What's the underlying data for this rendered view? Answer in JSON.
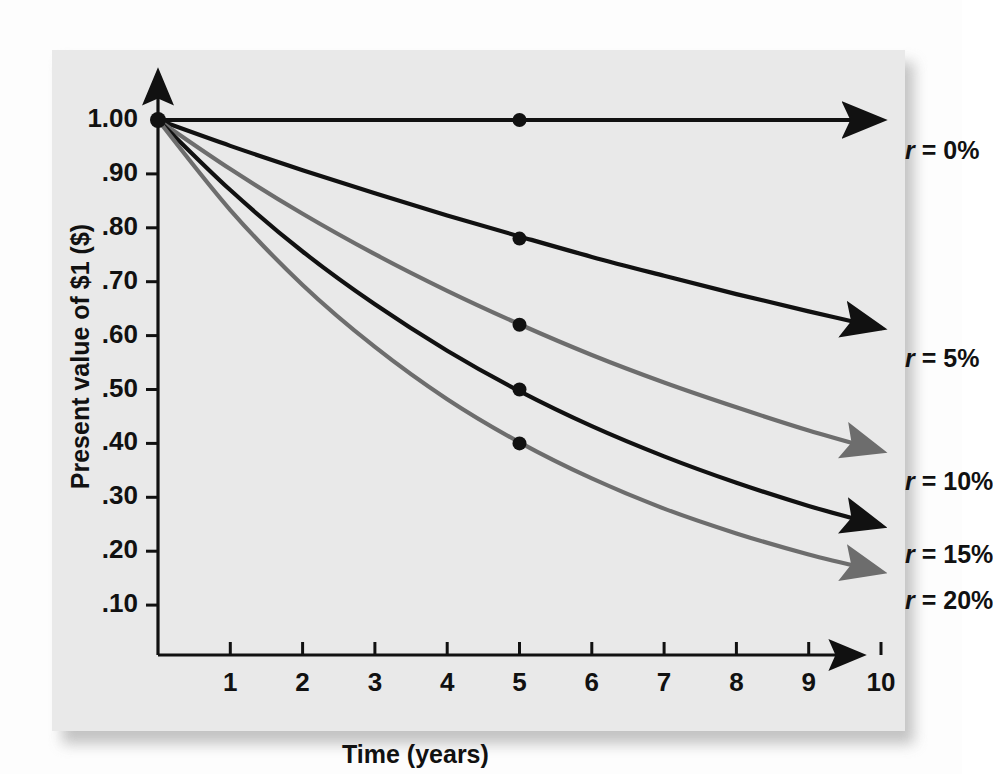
{
  "figure": {
    "background_color": "#e9e9e9",
    "page_color": "#fdfdfd"
  },
  "chart_data": {
    "type": "line",
    "title": "",
    "xlabel": "Time (years)",
    "ylabel": "Present value of $1 ($)",
    "xlim": [
      0,
      10
    ],
    "ylim": [
      0,
      1.0
    ],
    "grid": false,
    "legend_position": "right-inline-labels",
    "x": [
      0,
      1,
      2,
      3,
      4,
      5,
      6,
      7,
      8,
      9,
      10
    ],
    "xtick_labels": [
      "1",
      "2",
      "3",
      "4",
      "5",
      "6",
      "7",
      "8",
      "9",
      "10"
    ],
    "xticks": [
      1,
      2,
      3,
      4,
      5,
      6,
      7,
      8,
      9,
      10
    ],
    "ytick_labels": [
      "1.00",
      ".90",
      ".80",
      ".70",
      ".60",
      ".50",
      ".40",
      ".30",
      ".20",
      ".10"
    ],
    "yticks": [
      1.0,
      0.9,
      0.8,
      0.7,
      0.6,
      0.5,
      0.4,
      0.3,
      0.2,
      0.1
    ],
    "marker_x": 5,
    "series": [
      {
        "name": "r = 0%",
        "rate": 0.0,
        "color": "#111111",
        "values": [
          1.0,
          1.0,
          1.0,
          1.0,
          1.0,
          1.0,
          1.0,
          1.0,
          1.0,
          1.0,
          1.0
        ],
        "marker_value": 1.0,
        "label_prefix": "r",
        "label_suffix": " = 0%"
      },
      {
        "name": "r = 5%",
        "rate": 0.05,
        "color": "#111111",
        "values": [
          1.0,
          0.952,
          0.907,
          0.864,
          0.823,
          0.784,
          0.746,
          0.711,
          0.677,
          0.645,
          0.614
        ],
        "marker_value": 0.78,
        "label_prefix": "r",
        "label_suffix": " = 5%"
      },
      {
        "name": "r = 10%",
        "rate": 0.1,
        "color": "#6d6d6d",
        "values": [
          1.0,
          0.909,
          0.826,
          0.751,
          0.683,
          0.621,
          0.564,
          0.513,
          0.467,
          0.424,
          0.386
        ],
        "marker_value": 0.62,
        "label_prefix": "r",
        "label_suffix": " = 10%"
      },
      {
        "name": "r = 15%",
        "rate": 0.15,
        "color": "#111111",
        "values": [
          1.0,
          0.87,
          0.756,
          0.658,
          0.572,
          0.497,
          0.432,
          0.376,
          0.327,
          0.284,
          0.247
        ],
        "marker_value": 0.5,
        "label_prefix": "r",
        "label_suffix": " = 15%"
      },
      {
        "name": "r = 20%",
        "rate": 0.2,
        "color": "#6d6d6d",
        "values": [
          1.0,
          0.833,
          0.694,
          0.579,
          0.482,
          0.402,
          0.335,
          0.279,
          0.233,
          0.194,
          0.162
        ],
        "marker_value": 0.4,
        "label_prefix": "r",
        "label_suffix": " = 20%"
      }
    ]
  }
}
